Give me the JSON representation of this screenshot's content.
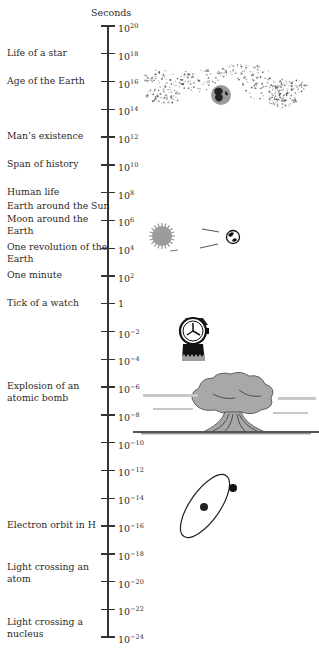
{
  "title": "Seconds",
  "axis": {
    "unit": "Seconds",
    "scale": "log10",
    "top_exponent": 20,
    "bottom_exponent": -24,
    "step": 2,
    "ticks": [
      {
        "base": "10",
        "exp": "20"
      },
      {
        "base": "10",
        "exp": "18"
      },
      {
        "base": "10",
        "exp": "16"
      },
      {
        "base": "10",
        "exp": "14"
      },
      {
        "base": "10",
        "exp": "12"
      },
      {
        "base": "10",
        "exp": "10"
      },
      {
        "base": "10",
        "exp": "8"
      },
      {
        "base": "10",
        "exp": "6"
      },
      {
        "base": "10",
        "exp": "4"
      },
      {
        "base": "10",
        "exp": "2"
      },
      {
        "base": "1",
        "exp": ""
      },
      {
        "base": "10",
        "exp": "−2"
      },
      {
        "base": "10",
        "exp": "−4"
      },
      {
        "base": "10",
        "exp": "−6"
      },
      {
        "base": "10",
        "exp": "−8"
      },
      {
        "base": "10",
        "exp": "−10"
      },
      {
        "base": "10",
        "exp": "−12"
      },
      {
        "base": "10",
        "exp": "−14"
      },
      {
        "base": "10",
        "exp": "−16"
      },
      {
        "base": "10",
        "exp": "−18"
      },
      {
        "base": "10",
        "exp": "−20"
      },
      {
        "base": "10",
        "exp": "−22"
      },
      {
        "base": "10",
        "exp": "−24"
      }
    ]
  },
  "events": [
    {
      "lines": [
        "Life of a star"
      ],
      "exponent": 18
    },
    {
      "lines": [
        "Age of the Earth"
      ],
      "exponent": 16
    },
    {
      "lines": [
        "Man’s existence"
      ],
      "exponent": 12
    },
    {
      "lines": [
        "Span of history"
      ],
      "exponent": 10
    },
    {
      "lines": [
        "Human life"
      ],
      "exponent": 8
    },
    {
      "lines": [
        "Earth around the Sun"
      ],
      "exponent": 7
    },
    {
      "lines": [
        "Moon around the",
        "Earth"
      ],
      "exponent": 6
    },
    {
      "lines": [
        "One revolution of the",
        "Earth"
      ],
      "exponent": 4
    },
    {
      "lines": [
        "One minute"
      ],
      "exponent": 2
    },
    {
      "lines": [
        "Tick of a watch"
      ],
      "exponent": 0
    },
    {
      "lines": [
        "Explosion of an",
        "atomic bomb"
      ],
      "exponent": -6
    },
    {
      "lines": [
        "Electron orbit in H"
      ],
      "exponent": -16
    },
    {
      "lines": [
        "Light crossing an",
        "atom"
      ],
      "exponent": -19
    },
    {
      "lines": [
        "Light crossing a",
        "nucleus"
      ],
      "exponent": -23
    }
  ],
  "illustrations": [
    {
      "name": "galaxy-with-earth",
      "near_exponent": 15
    },
    {
      "name": "sun-and-earth-orbit",
      "near_exponent": 5
    },
    {
      "name": "wristwatch",
      "near_exponent": -3
    },
    {
      "name": "mushroom-cloud",
      "near_exponent": -7
    },
    {
      "name": "hydrogen-atom-orbit",
      "near_exponent": -14
    }
  ]
}
